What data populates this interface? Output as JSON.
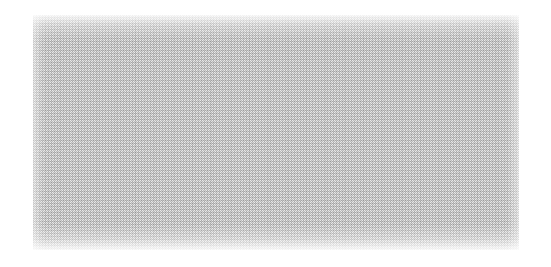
{
  "canvas": {
    "width": 551,
    "height": 267,
    "background_color": "#ffffff"
  },
  "panel": {
    "label": "",
    "content_text": "",
    "x": 33,
    "y": 15,
    "width": 486,
    "height": 235,
    "fill_color": "#e9e9e9",
    "dither_color": "#b9b9b9",
    "border_color": "#ffffff",
    "pattern": "halftone-dither",
    "state": "empty"
  }
}
